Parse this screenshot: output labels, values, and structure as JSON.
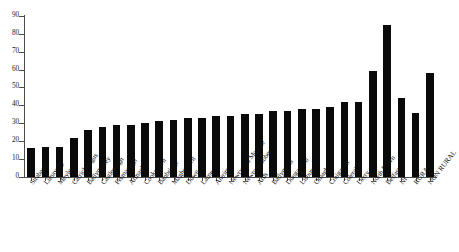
{
  "chart_data": {
    "type": "bar",
    "title": "",
    "subtitle": "",
    "xlabel": "",
    "ylabel": "",
    "ylim": [
      0,
      90
    ],
    "ytick_step": 10,
    "yticks": [
      0,
      10,
      20,
      30,
      40,
      50,
      60,
      70,
      80,
      90
    ],
    "ytick_labels": [
      "0",
      "10",
      "20",
      "30",
      "40",
      "50",
      "60",
      "70",
      "80",
      "90"
    ],
    "grid": false,
    "legend": false,
    "legend_position": "none",
    "bar_color": "#0a0a0a",
    "axis_color": "#4c4c4c",
    "categories": [
      "Strabane",
      "Limavady",
      "Moyle",
      "Carrickfergus",
      "Ballymoney",
      "Castlereagh",
      "Fermanagh",
      "Armagh",
      "Cookstown",
      "Banbridge",
      "Magherafelt",
      "Down",
      "Larne",
      "Antrim",
      "Newry and Mourne",
      "Newtownabbey",
      "Ards",
      "Ballymena",
      "Dungannon",
      "Lisburn",
      "Omagh",
      "Craigavon",
      "Coleraine",
      "Derry",
      "North Down",
      "Belfast",
      "NI",
      "RURAL",
      "NON RURAL"
    ],
    "values": [
      16,
      17,
      17,
      22,
      26,
      28,
      29,
      29,
      30,
      31,
      32,
      33,
      33,
      34,
      34,
      35,
      35,
      37,
      37,
      38,
      38,
      39,
      42,
      42,
      59,
      85,
      44,
      36,
      58
    ],
    "series": [
      {
        "name": "Percentage",
        "values": [
          16,
          17,
          17,
          22,
          26,
          28,
          29,
          29,
          30,
          31,
          32,
          33,
          33,
          34,
          34,
          35,
          35,
          37,
          37,
          38,
          38,
          39,
          42,
          42,
          59,
          85,
          44,
          36,
          58
        ]
      }
    ]
  }
}
